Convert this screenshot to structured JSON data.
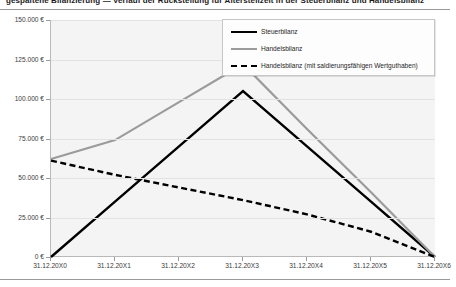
{
  "page": {
    "cut_heading": "gespaltene Bilanzierung — Verlauf der Rückstellung für Altersteilzeit in der Steuerbilanz und Handelsbilanz"
  },
  "legend": {
    "position": "top-right",
    "items": [
      {
        "label": "Steuerbilanz",
        "style": "solid",
        "color": "#000000"
      },
      {
        "label": "Handelsbilanz",
        "style": "solid",
        "color": "#9b9b9b"
      },
      {
        "label": "Handelsbilanz (mit saldierungsfähigen Wertguthaben)",
        "style": "dashed",
        "color": "#000000"
      }
    ]
  },
  "axes": {
    "y_ticks": [
      "0 €",
      "25.000 €",
      "50.000 €",
      "75.000 €",
      "100.000 €",
      "125.000 €",
      "150.000 €"
    ],
    "x_ticks": [
      "31.12.20X0",
      "31.12.20X1",
      "31.12.20X2",
      "31.12.20X3",
      "31.12.20X4",
      "31.12.20X5",
      "31.12.20X6"
    ]
  },
  "colors": {
    "plot_background": "#f4f4f4",
    "gridline": "#e2e2e2",
    "axis": "#b9b9b9",
    "steuerbilanz": "#000000",
    "handelsbilanz": "#9b9b9b",
    "handelsbilanz_saldiert": "#000000"
  },
  "chart_data": {
    "type": "line",
    "title": "",
    "xlabel": "",
    "ylabel": "",
    "grid": true,
    "legend_position": "top-right",
    "ylim": [
      0,
      150000
    ],
    "ytick_values": [
      0,
      25000,
      50000,
      75000,
      100000,
      125000,
      150000
    ],
    "ytick_labels": [
      "0 €",
      "25.000 €",
      "50.000 €",
      "75.000 €",
      "100.000 €",
      "125.000 €",
      "150.000 €"
    ],
    "categories": [
      "31.12.20X0",
      "31.12.20X1",
      "31.12.20X2",
      "31.12.20X3",
      "31.12.20X4",
      "31.12.20X5",
      "31.12.20X6"
    ],
    "series": [
      {
        "name": "Steuerbilanz",
        "style": "solid",
        "color": "#000000",
        "values": [
          0,
          35000,
          70000,
          105000,
          70000,
          35000,
          0
        ]
      },
      {
        "name": "Handelsbilanz",
        "style": "solid",
        "color": "#9b9b9b",
        "values": [
          62000,
          74000,
          98000,
          122000,
          81000,
          41000,
          0
        ]
      },
      {
        "name": "Handelsbilanz (mit saldierungsfähigen Wertguthaben)",
        "style": "dashed",
        "color": "#000000",
        "values": [
          61000,
          52000,
          44000,
          36000,
          27000,
          16000,
          0
        ]
      }
    ]
  }
}
